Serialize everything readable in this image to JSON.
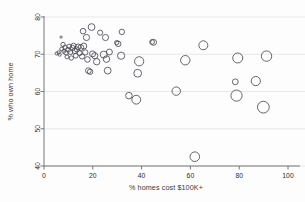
{
  "chart_data": {
    "type": "scatter",
    "title": "",
    "xlabel": "% homes cost $100K+",
    "ylabel": "% who own home",
    "xlim": [
      0,
      100
    ],
    "ylim": [
      40,
      80
    ],
    "xticks": [
      0,
      20,
      40,
      60,
      80,
      100
    ],
    "yticks": [
      40,
      50,
      60,
      70,
      80
    ],
    "grid": true,
    "legend": false,
    "marker": "open-circle",
    "size_encoding": "bubble-area",
    "points": [
      {
        "x": 5.2,
        "y": 70.2,
        "r": 1.6
      },
      {
        "x": 6.0,
        "y": 70.5,
        "r": 1.7
      },
      {
        "x": 6.4,
        "y": 69.9,
        "r": 1.6
      },
      {
        "x": 7.0,
        "y": 74.6,
        "r": 1.1
      },
      {
        "x": 7.3,
        "y": 71.4,
        "r": 2.0
      },
      {
        "x": 7.8,
        "y": 72.6,
        "r": 2.2
      },
      {
        "x": 8.1,
        "y": 70.8,
        "r": 2.0
      },
      {
        "x": 8.6,
        "y": 71.9,
        "r": 2.1
      },
      {
        "x": 9.0,
        "y": 70.4,
        "r": 2.3
      },
      {
        "x": 9.4,
        "y": 69.3,
        "r": 2.0
      },
      {
        "x": 9.9,
        "y": 71.2,
        "r": 2.4
      },
      {
        "x": 10.3,
        "y": 72.1,
        "r": 2.3
      },
      {
        "x": 10.8,
        "y": 70.6,
        "r": 2.5
      },
      {
        "x": 11.2,
        "y": 69.0,
        "r": 2.2
      },
      {
        "x": 11.7,
        "y": 71.7,
        "r": 2.6
      },
      {
        "x": 12.1,
        "y": 72.3,
        "r": 2.5
      },
      {
        "x": 12.6,
        "y": 70.9,
        "r": 2.7
      },
      {
        "x": 13.0,
        "y": 69.6,
        "r": 2.4
      },
      {
        "x": 13.5,
        "y": 71.3,
        "r": 2.6
      },
      {
        "x": 14.0,
        "y": 72.0,
        "r": 2.8
      },
      {
        "x": 14.6,
        "y": 70.3,
        "r": 2.5
      },
      {
        "x": 15.1,
        "y": 71.8,
        "r": 2.9
      },
      {
        "x": 15.6,
        "y": 69.4,
        "r": 2.6
      },
      {
        "x": 16.0,
        "y": 76.2,
        "r": 2.8
      },
      {
        "x": 16.3,
        "y": 72.2,
        "r": 3.0
      },
      {
        "x": 16.9,
        "y": 70.5,
        "r": 2.7
      },
      {
        "x": 17.4,
        "y": 74.5,
        "r": 3.1
      },
      {
        "x": 17.8,
        "y": 68.6,
        "r": 2.8
      },
      {
        "x": 18.2,
        "y": 65.6,
        "r": 2.9
      },
      {
        "x": 18.9,
        "y": 65.3,
        "r": 2.7
      },
      {
        "x": 19.5,
        "y": 77.3,
        "r": 3.4
      },
      {
        "x": 19.9,
        "y": 70.1,
        "r": 3.0
      },
      {
        "x": 20.8,
        "y": 69.6,
        "r": 3.1
      },
      {
        "x": 21.6,
        "y": 68.0,
        "r": 3.2
      },
      {
        "x": 23.0,
        "y": 75.8,
        "r": 2.6
      },
      {
        "x": 24.5,
        "y": 69.9,
        "r": 3.5
      },
      {
        "x": 25.2,
        "y": 74.5,
        "r": 3.1
      },
      {
        "x": 25.6,
        "y": 68.7,
        "r": 3.3
      },
      {
        "x": 26.1,
        "y": 65.6,
        "r": 3.4
      },
      {
        "x": 26.8,
        "y": 70.6,
        "r": 3.0
      },
      {
        "x": 29.8,
        "y": 73.1,
        "r": 2.2
      },
      {
        "x": 30.4,
        "y": 72.8,
        "r": 2.8
      },
      {
        "x": 31.6,
        "y": 69.6,
        "r": 3.6
      },
      {
        "x": 31.9,
        "y": 76.0,
        "r": 2.7
      },
      {
        "x": 34.8,
        "y": 58.9,
        "r": 3.3
      },
      {
        "x": 37.8,
        "y": 57.8,
        "r": 4.4
      },
      {
        "x": 38.4,
        "y": 64.9,
        "r": 3.9
      },
      {
        "x": 39.0,
        "y": 68.1,
        "r": 4.6
      },
      {
        "x": 44.3,
        "y": 73.3,
        "r": 2.4
      },
      {
        "x": 44.9,
        "y": 73.2,
        "r": 3.0
      },
      {
        "x": 54.2,
        "y": 60.1,
        "r": 4.2
      },
      {
        "x": 57.9,
        "y": 68.4,
        "r": 4.7
      },
      {
        "x": 61.8,
        "y": 42.5,
        "r": 4.8
      },
      {
        "x": 65.3,
        "y": 72.4,
        "r": 4.5
      },
      {
        "x": 78.4,
        "y": 62.6,
        "r": 2.9
      },
      {
        "x": 78.9,
        "y": 58.9,
        "r": 5.6
      },
      {
        "x": 79.4,
        "y": 69.0,
        "r": 5.0
      },
      {
        "x": 86.8,
        "y": 62.8,
        "r": 4.6
      },
      {
        "x": 89.9,
        "y": 55.8,
        "r": 5.9
      },
      {
        "x": 91.2,
        "y": 69.5,
        "r": 5.2
      }
    ]
  }
}
